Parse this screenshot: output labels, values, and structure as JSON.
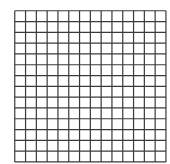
{
  "grid": {
    "rows": 14,
    "cols": 14,
    "cell_size": 10.8,
    "line_color": "#3a3a3a",
    "line_width": 1.2,
    "background": "#ffffff"
  }
}
